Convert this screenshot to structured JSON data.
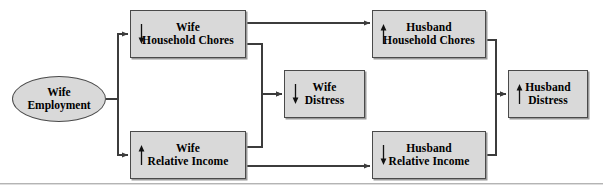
{
  "diagram": {
    "type": "path-model-flow-diagram",
    "nodes": [
      {
        "id": "wife-employment",
        "label": "Wife\nEmployment",
        "shape": "oval",
        "direction_marker": "none",
        "x": 12,
        "y": 76,
        "w": 94,
        "h": 46
      },
      {
        "id": "wife-household-chores",
        "label": "Wife\nHousehold Chores",
        "shape": "rect",
        "direction_marker": "down",
        "x": 130,
        "y": 10,
        "w": 116,
        "h": 48
      },
      {
        "id": "wife-relative-income",
        "label": "Wife\nRelative Income",
        "shape": "rect",
        "direction_marker": "up",
        "x": 130,
        "y": 131,
        "w": 116,
        "h": 48
      },
      {
        "id": "wife-distress",
        "label": "Wife\nDistress",
        "shape": "rect",
        "direction_marker": "down",
        "x": 284,
        "y": 70,
        "w": 81,
        "h": 48
      },
      {
        "id": "husband-household-chores",
        "label": "Husband\nHousehold Chores",
        "shape": "rect",
        "direction_marker": "up",
        "x": 372,
        "y": 10,
        "w": 114,
        "h": 48
      },
      {
        "id": "husband-relative-income",
        "label": "Husband\nRelative Income",
        "shape": "rect",
        "direction_marker": "down",
        "x": 372,
        "y": 131,
        "w": 114,
        "h": 48
      },
      {
        "id": "husband-distress",
        "label": "Husband\nDistress",
        "shape": "rect",
        "direction_marker": "up",
        "x": 508,
        "y": 70,
        "w": 80,
        "h": 48
      }
    ],
    "edges": [
      {
        "from": "wife-employment",
        "to": "wife-household-chores"
      },
      {
        "from": "wife-employment",
        "to": "wife-relative-income"
      },
      {
        "from": "wife-household-chores",
        "to": "husband-household-chores"
      },
      {
        "from": "wife-household-chores",
        "to": "wife-distress"
      },
      {
        "from": "wife-relative-income",
        "to": "wife-distress"
      },
      {
        "from": "wife-relative-income",
        "to": "husband-relative-income"
      },
      {
        "from": "husband-household-chores",
        "to": "husband-distress"
      },
      {
        "from": "husband-relative-income",
        "to": "husband-distress"
      }
    ],
    "colors": {
      "node_fill": "#d9d9d9",
      "node_border": "#4a4a4a",
      "connector": "#3c3c3c",
      "text": "#000000",
      "rule": "#b4b4b4",
      "background": "#ffffff"
    },
    "bottom_rule_y": 183
  }
}
